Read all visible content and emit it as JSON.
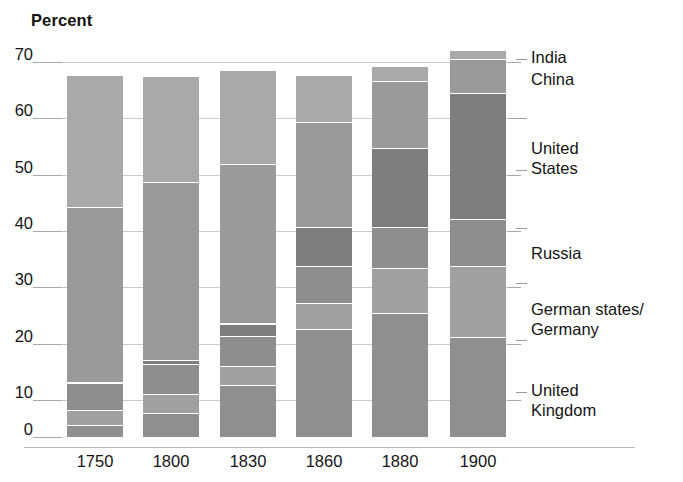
{
  "chart_data": {
    "type": "bar",
    "subtype": "stacked-bar",
    "title": "",
    "ylabel": "Percent",
    "xlabel": "",
    "ylim": [
      0,
      70
    ],
    "yticks": [
      0,
      10,
      20,
      30,
      40,
      50,
      60,
      70
    ],
    "ytick_labels": [
      "0",
      "10",
      "20",
      "30",
      "40",
      "50",
      "60",
      "70"
    ],
    "grid": true,
    "grid_axis": "y",
    "legend_position": "right",
    "categories": [
      "1750",
      "1800",
      "1830",
      "1860",
      "1880",
      "1900"
    ],
    "series": [
      {
        "name": "United Kingdom",
        "values": [
          2.0,
          4.3,
          9.5,
          19.9,
          22.9,
          18.5
        ]
      },
      {
        "name": "German states/Germany",
        "values": [
          2.9,
          3.5,
          3.5,
          4.9,
          8.5,
          13.2
        ]
      },
      {
        "name": "Russia",
        "values": [
          5.0,
          5.6,
          5.6,
          7.0,
          7.6,
          8.8
        ]
      },
      {
        "name": "United States",
        "values": [
          0.1,
          0.8,
          2.4,
          7.2,
          14.7,
          23.6
        ]
      },
      {
        "name": "China",
        "values": [
          32.8,
          33.3,
          29.8,
          19.7,
          12.5,
          6.2
        ]
      },
      {
        "name": "India",
        "values": [
          24.5,
          19.7,
          17.6,
          8.6,
          2.8,
          1.7
        ]
      }
    ],
    "totals": [
      67.3,
      67.2,
      68.4,
      67.3,
      69.0,
      72.0
    ],
    "colors": {
      "united_kingdom": "#8f8f8f",
      "german_states_germany": "#a0a0a0",
      "russia": "#8e8e8e",
      "united_states": "#7e7e7e",
      "china": "#9a9a9a",
      "india": "#a9a9a9",
      "gridline": "#c9c9c9",
      "axis": "#b7b7b7",
      "text": "#141414",
      "background": "#ffffff"
    }
  },
  "axis": {
    "y_title": "Percent",
    "ticks": [
      {
        "label": "70",
        "value": 70
      },
      {
        "label": "60",
        "value": 60
      },
      {
        "label": "50",
        "value": 50
      },
      {
        "label": "40",
        "value": 40
      },
      {
        "label": "30",
        "value": 30
      },
      {
        "label": "20",
        "value": 20
      },
      {
        "label": "10",
        "value": 10
      },
      {
        "label": "0",
        "value": 0
      }
    ],
    "x_labels": [
      "1750",
      "1800",
      "1830",
      "1860",
      "1880",
      "1900"
    ]
  },
  "legend": {
    "entries": [
      {
        "label": "India"
      },
      {
        "label": "China"
      },
      {
        "label": "United\nStates"
      },
      {
        "label": "Russia"
      },
      {
        "label": "German states/\nGermany"
      },
      {
        "label": "United\nKingdom"
      }
    ]
  }
}
